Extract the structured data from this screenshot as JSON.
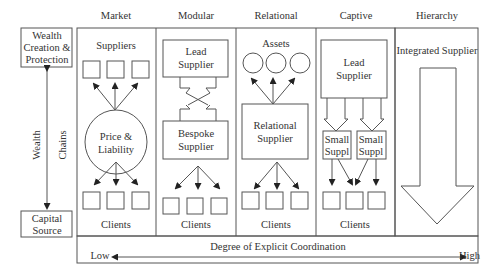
{
  "left_axis": {
    "top_box": [
      "Wealth",
      "Creation &",
      "Protection"
    ],
    "bottom_box": [
      "Capital",
      "Source"
    ],
    "label_left": "Wealth",
    "label_right": "Chains"
  },
  "columns": [
    {
      "header": "Market",
      "top_label": "Suppliers",
      "center": [
        "Price &",
        "Liability"
      ],
      "bottom_label": "Clients"
    },
    {
      "header": "Modular",
      "top": [
        "Lead",
        "Supplier"
      ],
      "center": [
        "Bespoke",
        "Supplier"
      ],
      "bottom_label": "Clients"
    },
    {
      "header": "Relational",
      "top_label": "Assets",
      "center": [
        "Relational",
        "Supplier"
      ],
      "bottom_label": "Clients"
    },
    {
      "header": "Captive",
      "top": [
        "Lead",
        "Supplier"
      ],
      "small": [
        [
          "Small",
          "Suppl"
        ],
        [
          "Small",
          "Suppl"
        ]
      ],
      "bottom_label": "Clients"
    },
    {
      "header": "Hierarchy",
      "top_label": "Integrated Supplier"
    }
  ],
  "coordination": {
    "low": "Low",
    "high": "High",
    "title": "Degree of Explicit Coordination"
  },
  "colors": {
    "line": "#555555",
    "text": "#333333"
  }
}
